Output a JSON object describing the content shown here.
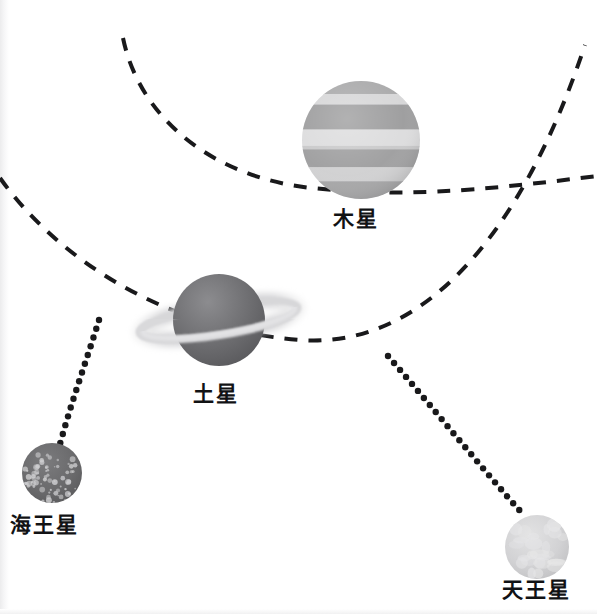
{
  "figure": {
    "background_color": "#ffffff",
    "width": 597,
    "height": 614
  },
  "planets": [
    {
      "id": "jupiter",
      "label": "木星",
      "icon": "banded-gas-giant-icon",
      "cx": 361,
      "cy": 140,
      "r": 59,
      "body_colors": [
        "#9b9b9b",
        "#d2d2d2",
        "#a6a6a6",
        "#e0e0e0",
        "#b0b0b0"
      ],
      "has_rings": false
    },
    {
      "id": "saturn",
      "label": "土星",
      "icon": "ringed-planet-icon",
      "cx": 219,
      "cy": 320,
      "r": 46,
      "body_colors": [
        "#6e6e70",
        "#5e5e60"
      ],
      "has_rings": true,
      "ring_color": "#c9c9cb",
      "ring_tilt_deg": -9,
      "ring_rx": 80,
      "ring_ry": 15
    },
    {
      "id": "neptune",
      "label": "海王星",
      "icon": "speckled-planet-icon",
      "cx": 52,
      "cy": 473,
      "r": 30,
      "body_colors": [
        "#6b6b6d",
        "#5a5a5c"
      ],
      "speckle_color": "#cfcfd1",
      "has_rings": false
    },
    {
      "id": "uranus",
      "label": "天王星",
      "icon": "pale-planet-icon",
      "cx": 537,
      "cy": 547,
      "r": 32,
      "body_colors": [
        "#d5d5d6",
        "#c4c4c6"
      ],
      "mottle_color": "#e6e6e7",
      "has_rings": false
    }
  ],
  "orbits": [
    {
      "id": "jupiter-orbit",
      "style": "dashed",
      "color": "#19191b",
      "stroke_width": 4,
      "dash": "13 11",
      "path": "M 123 38 C 140 120, 215 178, 312 188 C 400 197, 470 192, 597 176"
    },
    {
      "id": "saturn-orbit",
      "style": "dashed",
      "color": "#19191b",
      "stroke_width": 4,
      "dash": "13 11",
      "path": "M 0 178 C 60 262, 170 330, 300 340 C 420 349, 520 240, 585 45"
    }
  ],
  "connectors": [
    {
      "id": "neptune-connector",
      "style": "dotted",
      "color": "#19191b",
      "dot_radius": 3.2,
      "path": "M 99 320 C 88 356, 72 400, 60 444"
    },
    {
      "id": "uranus-connector",
      "style": "dotted",
      "color": "#19191b",
      "dot_radius": 3.2,
      "path": "M 388 356 C 430 404, 478 464, 521 512"
    }
  ]
}
